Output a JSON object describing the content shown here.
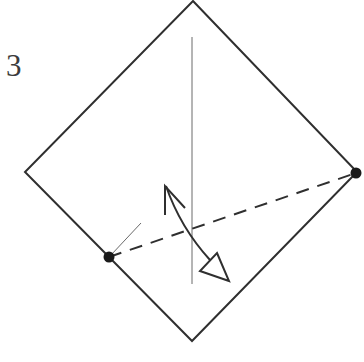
{
  "diagram": {
    "step_number": "3",
    "colors": {
      "line": "#2f2f2f",
      "thin_line": "#6a6a6a",
      "dot": "#1a1a1a",
      "background": "#ffffff"
    },
    "paper": {
      "shape": "square rotated 45deg (diamond)",
      "vertices": {
        "top": [
          193,
          1
        ],
        "right": [
          357,
          172
        ],
        "bottom": [
          192,
          341
        ],
        "left": [
          25,
          172
        ]
      }
    },
    "crease_line": {
      "type": "vertical thin line",
      "from": [
        192,
        37
      ],
      "to": [
        192,
        284
      ]
    },
    "reference_points": [
      {
        "name": "left-point",
        "at": [
          109,
          257
        ]
      },
      {
        "name": "right-point",
        "at": [
          356,
          173
        ]
      }
    ],
    "fold_line": {
      "type": "dashed valley fold",
      "from": [
        109,
        257
      ],
      "to": [
        356,
        173
      ]
    },
    "short_guide_line": {
      "from": [
        111,
        255
      ],
      "to": [
        141,
        223
      ]
    },
    "fold_arrow": {
      "type": "curved two-way arrow",
      "start_head": "open-v",
      "end_head": "hollow-triangle",
      "start": [
        166,
        185
      ],
      "end": [
        228,
        280
      ]
    },
    "caption_clipped": "…"
  }
}
